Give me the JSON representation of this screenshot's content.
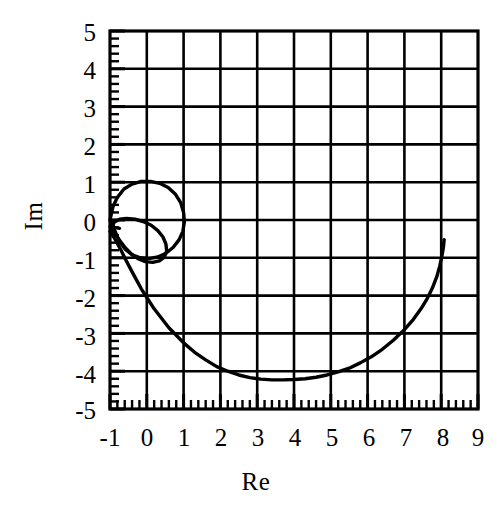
{
  "chart_data": {
    "type": "line",
    "title": "",
    "xlabel": "Re",
    "ylabel": "Im",
    "xlim": [
      -1,
      9
    ],
    "ylim": [
      -5,
      5
    ],
    "xticks": [
      "-1",
      "0",
      "1",
      "2",
      "3",
      "4",
      "5",
      "6",
      "7",
      "8",
      "9"
    ],
    "yticks": [
      "5",
      "4",
      "3",
      "2",
      "1",
      "0",
      "-1",
      "-2",
      "-3",
      "-4",
      "-5"
    ],
    "xtick_values": [
      -1,
      0,
      1,
      2,
      3,
      4,
      5,
      6,
      7,
      8,
      9
    ],
    "ytick_values": [
      5,
      4,
      3,
      2,
      1,
      0,
      -1,
      -2,
      -3,
      -4,
      -5
    ],
    "minor_ticks_per_major": 5,
    "grid": true,
    "legend": null,
    "line_color": "#000000",
    "grid_color": "#000000",
    "background": "#ffffff",
    "series": [
      {
        "name": "main-arc",
        "comment": "Large U-shaped arc from upper-left to right edge",
        "points": [
          [
            -1.0,
            -0.3
          ],
          [
            -0.9,
            -0.45
          ],
          [
            -0.8,
            -0.62
          ],
          [
            -0.7,
            -0.8
          ],
          [
            -0.6,
            -1.0
          ],
          [
            -0.45,
            -1.28
          ],
          [
            -0.3,
            -1.55
          ],
          [
            -0.15,
            -1.82
          ],
          [
            0.0,
            -2.05
          ],
          [
            0.2,
            -2.35
          ],
          [
            0.4,
            -2.6
          ],
          [
            0.6,
            -2.85
          ],
          [
            0.8,
            -3.05
          ],
          [
            1.0,
            -3.25
          ],
          [
            1.3,
            -3.5
          ],
          [
            1.6,
            -3.7
          ],
          [
            1.9,
            -3.88
          ],
          [
            2.2,
            -4.0
          ],
          [
            2.5,
            -4.1
          ],
          [
            2.8,
            -4.17
          ],
          [
            3.1,
            -4.21
          ],
          [
            3.4,
            -4.23
          ],
          [
            3.7,
            -4.23
          ],
          [
            4.0,
            -4.22
          ],
          [
            4.3,
            -4.2
          ],
          [
            4.6,
            -4.16
          ],
          [
            4.9,
            -4.1
          ],
          [
            5.2,
            -4.02
          ],
          [
            5.5,
            -3.92
          ],
          [
            5.8,
            -3.78
          ],
          [
            6.1,
            -3.62
          ],
          [
            6.4,
            -3.42
          ],
          [
            6.7,
            -3.18
          ],
          [
            7.0,
            -2.9
          ],
          [
            7.25,
            -2.62
          ],
          [
            7.45,
            -2.35
          ],
          [
            7.62,
            -2.08
          ],
          [
            7.76,
            -1.8
          ],
          [
            7.88,
            -1.5
          ],
          [
            7.96,
            -1.22
          ],
          [
            8.02,
            -0.95
          ],
          [
            8.06,
            -0.72
          ],
          [
            8.08,
            -0.52
          ]
        ]
      },
      {
        "name": "outer-loop",
        "comment": "Small circular loop near origin, top at Im = 1.0",
        "points": [
          [
            -1.0,
            0.0
          ],
          [
            -0.92,
            0.35
          ],
          [
            -0.8,
            0.6
          ],
          [
            -0.62,
            0.82
          ],
          [
            -0.4,
            0.95
          ],
          [
            -0.15,
            1.02
          ],
          [
            0.1,
            1.02
          ],
          [
            0.35,
            0.97
          ],
          [
            0.58,
            0.86
          ],
          [
            0.78,
            0.68
          ],
          [
            0.92,
            0.46
          ],
          [
            1.0,
            0.2
          ],
          [
            1.02,
            -0.05
          ],
          [
            0.98,
            -0.3
          ],
          [
            0.88,
            -0.52
          ],
          [
            0.72,
            -0.72
          ],
          [
            0.52,
            -0.88
          ],
          [
            0.3,
            -0.98
          ],
          [
            0.05,
            -1.02
          ],
          [
            -0.18,
            -1.0
          ],
          [
            -0.4,
            -0.92
          ],
          [
            -0.58,
            -0.78
          ],
          [
            -0.72,
            -0.6
          ],
          [
            -0.82,
            -0.4
          ],
          [
            -0.9,
            -0.2
          ],
          [
            -0.95,
            -0.05
          ]
        ]
      },
      {
        "name": "inner-loop",
        "comment": "Smaller inner loop, top at Im = 0.0 near Re = -0.8",
        "points": [
          [
            -0.96,
            -0.22
          ],
          [
            -0.88,
            -0.05
          ],
          [
            -0.74,
            0.02
          ],
          [
            -0.55,
            0.04
          ],
          [
            -0.32,
            0.02
          ],
          [
            -0.1,
            -0.04
          ],
          [
            0.12,
            -0.14
          ],
          [
            0.3,
            -0.28
          ],
          [
            0.44,
            -0.45
          ],
          [
            0.52,
            -0.64
          ],
          [
            0.54,
            -0.82
          ],
          [
            0.48,
            -0.98
          ],
          [
            0.34,
            -1.08
          ],
          [
            0.16,
            -1.12
          ],
          [
            -0.04,
            -1.1
          ],
          [
            -0.24,
            -1.02
          ],
          [
            -0.42,
            -0.9
          ],
          [
            -0.58,
            -0.74
          ],
          [
            -0.72,
            -0.56
          ],
          [
            -0.84,
            -0.4
          ],
          [
            -0.92,
            -0.28
          ]
        ]
      },
      {
        "name": "entry-tail",
        "comment": "Short stub at left axis entering the loops",
        "points": [
          [
            -1.0,
            -0.18
          ],
          [
            -0.86,
            -0.2
          ],
          [
            -0.74,
            -0.22
          ]
        ]
      }
    ]
  }
}
